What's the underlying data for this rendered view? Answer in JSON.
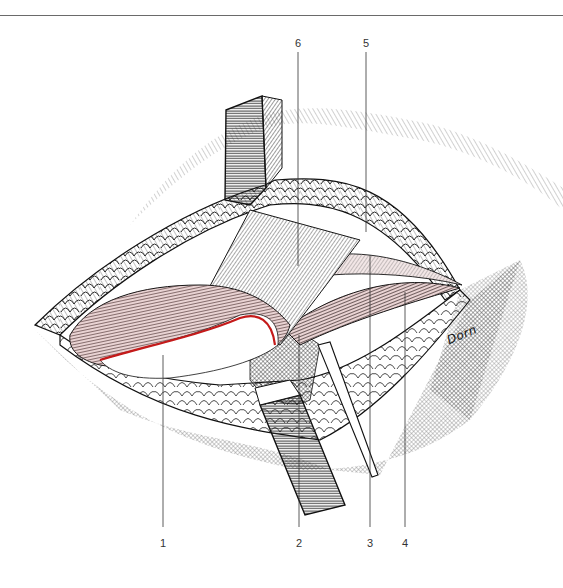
{
  "figure": {
    "type": "surgical anatomical illustration (line engraving)",
    "signature": "Dorn",
    "accent_color": "#c41a1a",
    "muscle_tint": "#e9d3d3",
    "ink_color": "#1a1a1a"
  },
  "labels": [
    {
      "id": "1",
      "text": "1",
      "x": 163,
      "y": 538,
      "line_top": 355,
      "line_bottom": 527
    },
    {
      "id": "2",
      "text": "2",
      "x": 299,
      "y": 538,
      "line_top": 335,
      "line_bottom": 527
    },
    {
      "id": "3",
      "text": "3",
      "x": 370,
      "y": 538,
      "line_top": 255,
      "line_bottom": 527
    },
    {
      "id": "4",
      "text": "4",
      "x": 405,
      "y": 538,
      "line_top": 292,
      "line_bottom": 527
    },
    {
      "id": "5",
      "text": "5",
      "x": 366,
      "y": 40,
      "line_top": 52,
      "line_bottom": 232
    },
    {
      "id": "6",
      "text": "6",
      "x": 298,
      "y": 40,
      "line_top": 52,
      "line_bottom": 266
    }
  ]
}
